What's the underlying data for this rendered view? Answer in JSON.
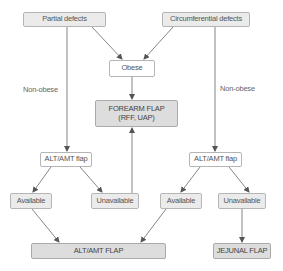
{
  "diagram": {
    "nodes": {
      "partial_defects": "Partial defects",
      "circumferential_defects": "Circumferential defects",
      "obese": "Obese",
      "forearm_flap_line1": "FOREARM FLAP",
      "forearm_flap_line2": "(RFF, UAP)",
      "alt_amt_flap_left": "ALT/AMT flap",
      "alt_amt_flap_right": "ALT/AMT flap",
      "available_left": "Available",
      "unavailable_left": "Unavailable",
      "available_right": "Available",
      "unavailable_right": "Unavailable",
      "alt_amt_flap_final": "ALT/AMT FLAP",
      "jejunal_flap": "JEJUNAL FLAP"
    },
    "edge_labels": {
      "non_obese_left": "Non-obese",
      "non_obese_right": "Non-obese"
    },
    "colors": {
      "box_border": "#b5b5b5",
      "box_fill_light": "#ebebeb",
      "box_fill_outcome": "#dddddd",
      "line": "#555555",
      "text": "#555555"
    }
  }
}
